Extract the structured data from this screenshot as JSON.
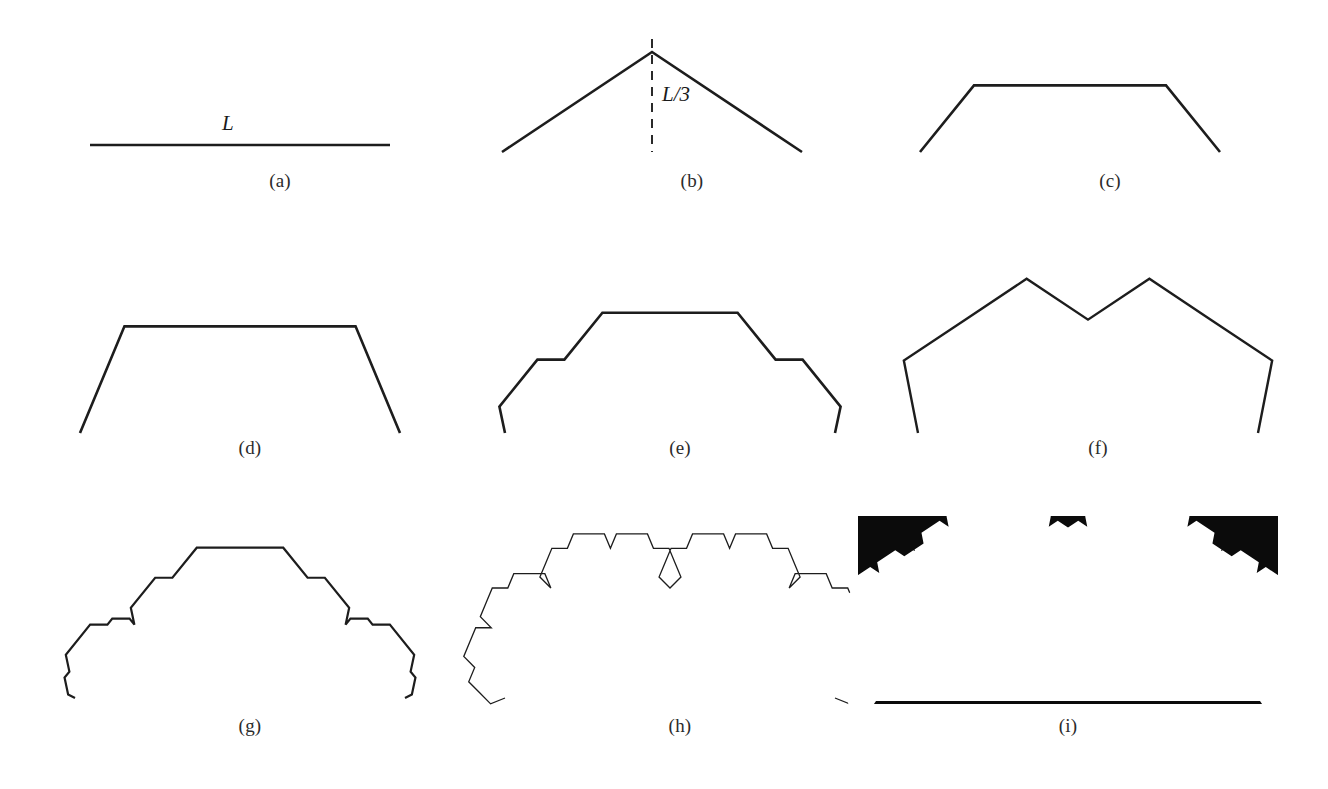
{
  "figure": {
    "background_color": "#ffffff",
    "ink_color": "#1d1d1d",
    "width": 1328,
    "height": 789
  },
  "labels": {
    "length_L": "L",
    "length_L_over_3": "L/3"
  },
  "captions": {
    "a": "(a)",
    "b": "(b)",
    "c": "(c)",
    "d": "(d)",
    "e": "(e)",
    "f": "(f)",
    "g": "(g)",
    "h": "(h)",
    "i": "(i)"
  },
  "chart_data": {
    "type": "line",
    "xlabel": "",
    "ylabel": "",
    "grid": false,
    "legend": "none",
    "panels": [
      {
        "key": "a",
        "caption": "(a)",
        "description": "initiator: a single straight segment of length L",
        "generator": "none",
        "iteration": 0,
        "annotation": "L",
        "viewbox": [
          0,
          0,
          420,
          150
        ],
        "base": [
          [
            20,
            110
          ],
          [
            320,
            110
          ]
        ],
        "stroke_width": 2.6
      },
      {
        "key": "b",
        "caption": "(b)",
        "description": "generator: tent with apex raised L/3 above midpoint, dashed height marker",
        "generator": "tent",
        "iteration": 1,
        "annotation": "L/3",
        "viewbox": [
          0,
          0,
          420,
          150
        ],
        "base": [
          [
            20,
            130
          ],
          [
            320,
            130
          ]
        ],
        "apex": [
          170,
          17
        ],
        "dashed": [
          [
            170,
            17
          ],
          [
            170,
            130
          ]
        ],
        "stroke_width": 2.6
      },
      {
        "key": "c",
        "caption": "(c)",
        "description": "generator: flat-topped trapezoid bump",
        "generator": "trapezoid",
        "iteration": 1,
        "viewbox": [
          0,
          0,
          420,
          150
        ],
        "base": [
          [
            20,
            130
          ],
          [
            320,
            130
          ]
        ],
        "stroke_width": 2.6
      },
      {
        "key": "d",
        "caption": "(d)",
        "description": "tent generator applied twice",
        "generator": "tent",
        "iteration": 2,
        "viewbox": [
          0,
          0,
          420,
          200
        ],
        "base": [
          [
            40,
            185
          ],
          [
            360,
            185
          ]
        ],
        "stroke_width": 2.6
      },
      {
        "key": "e",
        "caption": "(e)",
        "description": "trapezoid generator applied twice",
        "generator": "trapezoid",
        "iteration": 2,
        "viewbox": [
          0,
          0,
          420,
          200
        ],
        "base": [
          [
            35,
            185
          ],
          [
            365,
            185
          ]
        ],
        "stroke_width": 2.6
      },
      {
        "key": "f",
        "caption": "(f)",
        "description": "tent generator applied three times",
        "generator": "tent",
        "iteration": 3,
        "viewbox": [
          0,
          0,
          420,
          200
        ],
        "base": [
          [
            30,
            185
          ],
          [
            370,
            185
          ]
        ],
        "stroke_width": 2.4
      },
      {
        "key": "g",
        "caption": "(g)",
        "description": "trapezoid generator applied three times",
        "generator": "trapezoid",
        "iteration": 3,
        "viewbox": [
          0,
          0,
          420,
          210
        ],
        "base": [
          [
            35,
            190
          ],
          [
            365,
            190
          ]
        ],
        "stroke_width": 2.2
      },
      {
        "key": "h",
        "caption": "(h)",
        "description": "generator applied many times; outline develops loops and bulbs",
        "generator": "tent",
        "iteration": 6,
        "viewbox": [
          0,
          0,
          420,
          210
        ],
        "base": [
          [
            35,
            190
          ],
          [
            365,
            190
          ]
        ],
        "stroke_width": 1.3
      },
      {
        "key": "i",
        "caption": "(i)",
        "description": "limit set rendered as solid black field with the fractal region knocked out in white",
        "generator": "tent",
        "iteration": 7,
        "viewbox": [
          0,
          0,
          420,
          200
        ],
        "base": [
          [
            18,
            185
          ],
          [
            402,
            185
          ]
        ],
        "frame": [
          0,
          0,
          420,
          188
        ],
        "fill_color": "#0b0b0b",
        "hole_color": "#ffffff",
        "stroke_width": 0
      }
    ]
  },
  "layout": {
    "columns": 3,
    "rows": 3,
    "panel_positions": [
      {
        "key": "a",
        "left": 70,
        "top": 35,
        "width": 420,
        "height": 150,
        "caption_top": 170
      },
      {
        "key": "b",
        "left": 482,
        "top": 22,
        "width": 420,
        "height": 150,
        "caption_top": 170
      },
      {
        "key": "c",
        "left": 900,
        "top": 22,
        "width": 420,
        "height": 150,
        "caption_top": 170
      },
      {
        "key": "d",
        "left": 40,
        "top": 248,
        "width": 420,
        "height": 200,
        "caption_top": 437
      },
      {
        "key": "e",
        "left": 470,
        "top": 248,
        "width": 420,
        "height": 200,
        "caption_top": 437
      },
      {
        "key": "f",
        "left": 888,
        "top": 248,
        "width": 420,
        "height": 200,
        "caption_top": 437
      },
      {
        "key": "g",
        "left": 40,
        "top": 508,
        "width": 420,
        "height": 210,
        "caption_top": 715
      },
      {
        "key": "h",
        "left": 470,
        "top": 508,
        "width": 420,
        "height": 210,
        "caption_top": 715
      },
      {
        "key": "i",
        "left": 858,
        "top": 516,
        "width": 420,
        "height": 200,
        "caption_top": 715
      }
    ]
  }
}
